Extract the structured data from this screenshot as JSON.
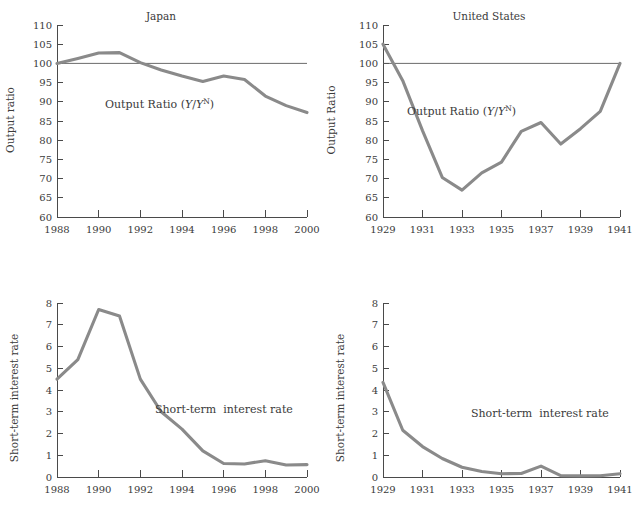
{
  "figure": {
    "background_color": "#ffffff",
    "line_color": "#8a8a8a",
    "axis_color": "#4a4a4a",
    "text_color": "#3a3a3a"
  },
  "panels": {
    "japan_output": {
      "title": "Japan",
      "ylabel": "Output ratio",
      "inline_label_prefix": "Output Ratio (",
      "inline_label_y1": "Y",
      "inline_label_slash": "/",
      "inline_label_y2": "Y",
      "inline_label_sup": "N",
      "inline_label_suffix": ")",
      "ytick_labels": [
        "60",
        "65",
        "70",
        "75",
        "80",
        "85",
        "90",
        "95",
        "100",
        "105",
        "110"
      ],
      "xtick_labels": [
        "1988",
        "1990",
        "1992",
        "1994",
        "1996",
        "1998",
        "2000"
      ],
      "reference_value": "100"
    },
    "us_output": {
      "title": "United States",
      "ylabel": "Output Ratio",
      "inline_label_prefix": "Output Ratio (",
      "inline_label_y1": "Y",
      "inline_label_slash": "/",
      "inline_label_y2": "Y",
      "inline_label_sup": "N",
      "inline_label_suffix": ")",
      "ytick_labels": [
        "60",
        "65",
        "70",
        "75",
        "80",
        "85",
        "90",
        "95",
        "100",
        "105",
        "110"
      ],
      "xtick_labels": [
        "1929",
        "1931",
        "1933",
        "1935",
        "1937",
        "1939",
        "1941"
      ],
      "reference_value": "100"
    },
    "japan_rate": {
      "title": "",
      "ylabel": "Short-term interest rate",
      "inline_label": "Short-term  interest rate",
      "ytick_labels": [
        "0",
        "1",
        "2",
        "3",
        "4",
        "5",
        "6",
        "7",
        "8"
      ],
      "xtick_labels": [
        "1988",
        "1990",
        "1992",
        "1994",
        "1996",
        "1998",
        "2000"
      ]
    },
    "us_rate": {
      "title": "",
      "ylabel": "Short-term interest rate",
      "inline_label": "Short-term  interest rate",
      "ytick_labels": [
        "0",
        "1",
        "2",
        "3",
        "4",
        "5",
        "6",
        "7",
        "8"
      ],
      "xtick_labels": [
        "1929",
        "1931",
        "1933",
        "1935",
        "1937",
        "1939",
        "1941"
      ]
    }
  },
  "chart_data": [
    {
      "id": "japan_output",
      "type": "line",
      "title": "Japan",
      "xlabel": "",
      "ylabel": "Output ratio",
      "xlim": [
        1988,
        2000
      ],
      "ylim": [
        60,
        110
      ],
      "ytick_step": 5,
      "xtick_step": 2,
      "grid": false,
      "legend": "inline",
      "series": [
        {
          "name": "Output Ratio (Y/Y^N)",
          "x": [
            1988,
            1989,
            1990,
            1991,
            1992,
            1993,
            1994,
            1995,
            1996,
            1997,
            1998,
            1999,
            2000
          ],
          "values": [
            100.0,
            101.3,
            102.7,
            102.8,
            100.2,
            98.3,
            96.7,
            95.3,
            96.7,
            95.8,
            91.5,
            89.0,
            87.2
          ]
        },
        {
          "name": "Reference line (100)",
          "x": [
            1988,
            2000
          ],
          "values": [
            100,
            100
          ],
          "style": "thin"
        }
      ]
    },
    {
      "id": "us_output",
      "type": "line",
      "title": "United States",
      "xlabel": "",
      "ylabel": "Output Ratio",
      "xlim": [
        1929,
        1941
      ],
      "ylim": [
        60,
        110
      ],
      "ytick_step": 5,
      "xtick_step": 2,
      "grid": false,
      "legend": "inline",
      "series": [
        {
          "name": "Output Ratio (Y/Y^N)",
          "x": [
            1929,
            1930,
            1931,
            1932,
            1933,
            1934,
            1935,
            1936,
            1937,
            1938,
            1939,
            1940,
            1941
          ],
          "values": [
            105.0,
            95.5,
            82.5,
            70.3,
            67.0,
            71.5,
            74.3,
            82.3,
            84.6,
            79.0,
            83.0,
            87.5,
            100.0
          ]
        },
        {
          "name": "Reference line (100)",
          "x": [
            1929,
            1941
          ],
          "values": [
            100,
            100
          ],
          "style": "thin"
        }
      ]
    },
    {
      "id": "japan_rate",
      "type": "line",
      "title": "",
      "xlabel": "",
      "ylabel": "Short-term interest rate",
      "xlim": [
        1988,
        2000
      ],
      "ylim": [
        0,
        8
      ],
      "ytick_step": 1,
      "xtick_step": 2,
      "grid": false,
      "legend": "inline",
      "series": [
        {
          "name": "Short-term  interest rate",
          "x": [
            1988,
            1989,
            1990,
            1991,
            1992,
            1993,
            1994,
            1995,
            1996,
            1997,
            1998,
            1999,
            2000
          ],
          "values": [
            4.5,
            5.4,
            7.7,
            7.4,
            4.5,
            3.0,
            2.2,
            1.2,
            0.62,
            0.6,
            0.75,
            0.55,
            0.57
          ]
        }
      ]
    },
    {
      "id": "us_rate",
      "type": "line",
      "title": "",
      "xlabel": "",
      "ylabel": "Short-term interest rate",
      "xlim": [
        1929,
        1941
      ],
      "ylim": [
        0,
        8
      ],
      "ytick_step": 1,
      "xtick_step": 2,
      "grid": false,
      "legend": "inline",
      "series": [
        {
          "name": "Short-term  interest rate",
          "x": [
            1929,
            1930,
            1931,
            1932,
            1933,
            1934,
            1935,
            1936,
            1937,
            1938,
            1939,
            1940,
            1941
          ],
          "values": [
            4.35,
            2.15,
            1.4,
            0.85,
            0.45,
            0.25,
            0.15,
            0.16,
            0.5,
            0.06,
            0.05,
            0.06,
            0.15
          ]
        }
      ]
    }
  ]
}
